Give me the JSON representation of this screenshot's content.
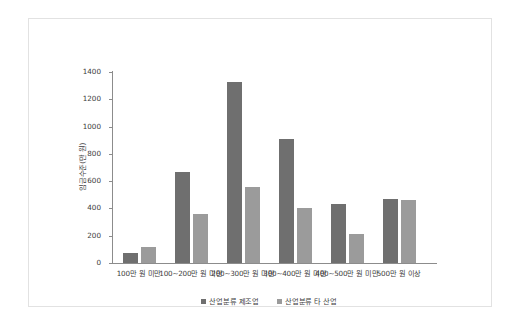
{
  "chart_data": {
    "type": "bar",
    "title": "",
    "subtitle": "",
    "xlabel": "",
    "ylabel": "임금수준(만 원)",
    "ylim": [
      0,
      1400
    ],
    "yticks": [
      0,
      200,
      400,
      600,
      800,
      1000,
      1200,
      1400
    ],
    "ytick_labels": [
      "0",
      "200",
      "400",
      "600",
      "800",
      "1000",
      "1200",
      "1400"
    ],
    "grid": false,
    "legend_position": "bottom-center",
    "categories": [
      "100만 원 미만",
      "100~200만 원 미만",
      "200~300만 원 미만",
      "300~400만 원 미만",
      "400~500만 원 미만",
      "500만 원 이상"
    ],
    "series": [
      {
        "name": "산업분류 제조업",
        "color": "#6f6f6f",
        "values": [
          75,
          670,
          1325,
          910,
          430,
          470
        ]
      },
      {
        "name": "산업분류 타 산업",
        "color": "#9b9b9b",
        "values": [
          120,
          360,
          555,
          400,
          215,
          465
        ]
      }
    ],
    "annotations": []
  },
  "colors": {
    "series_dark": "#6f6f6f",
    "series_light": "#9b9b9b",
    "axis": "#8c8c8c",
    "text": "#3d3d3d",
    "frame_border": "#e2e2e2",
    "background": "#ffffff"
  }
}
